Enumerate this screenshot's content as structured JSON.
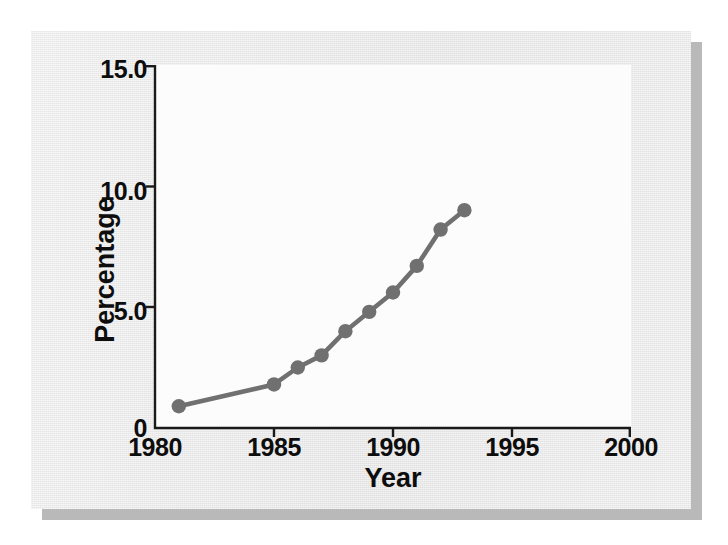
{
  "figure": {
    "panel_bg": "#eeeeee",
    "plot_bg": "#fcfcfc",
    "axis_color": "#1a1a1a",
    "series_color": "#707070",
    "text_color": "#0d0d0d"
  },
  "chart_data": {
    "type": "line",
    "title": "",
    "subtitle": "",
    "xlabel": "Year",
    "ylabel": "Percentage",
    "xlim": [
      1980,
      2000
    ],
    "ylim": [
      0,
      15
    ],
    "xticks": [
      "1980",
      "1985",
      "1990",
      "1995",
      "2000"
    ],
    "xtick_values": [
      1980,
      1985,
      1990,
      1995,
      2000
    ],
    "yticks": [
      "0",
      "5.0",
      "10.0",
      "15.0"
    ],
    "ytick_values": [
      0,
      5,
      10,
      15
    ],
    "grid": false,
    "legend": null,
    "marker": "circle",
    "series": [
      {
        "name": "Percentage",
        "color": "#707070",
        "x": [
          1981,
          1985,
          1986,
          1987,
          1988,
          1989,
          1990,
          1991,
          1992,
          1993
        ],
        "values": [
          0.9,
          1.8,
          2.5,
          3.0,
          4.0,
          4.8,
          5.6,
          6.7,
          8.2,
          9.0
        ],
        "points": [
          {
            "x": 1981,
            "y": 0.9
          },
          {
            "x": 1985,
            "y": 1.8
          },
          {
            "x": 1986,
            "y": 2.5
          },
          {
            "x": 1987,
            "y": 3.0
          },
          {
            "x": 1988,
            "y": 4.0
          },
          {
            "x": 1989,
            "y": 4.8
          },
          {
            "x": 1990,
            "y": 5.6
          },
          {
            "x": 1991,
            "y": 6.7
          },
          {
            "x": 1992,
            "y": 8.2
          },
          {
            "x": 1993,
            "y": 9.0
          }
        ]
      }
    ],
    "annotations": []
  }
}
